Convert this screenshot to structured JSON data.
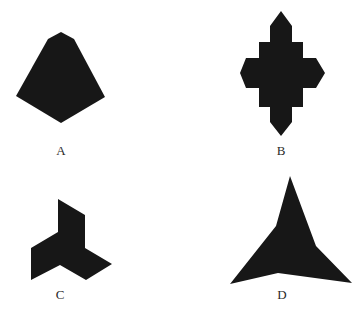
{
  "figure": {
    "shape_color": "#171717",
    "background_color": "#ffffff",
    "items": [
      {
        "label": "A",
        "shape": "pentagonal-kite"
      },
      {
        "label": "B",
        "shape": "stepped-cross-diamond"
      },
      {
        "label": "C",
        "shape": "three-blade-pinwheel"
      },
      {
        "label": "D",
        "shape": "concave-three-point-star"
      }
    ]
  }
}
